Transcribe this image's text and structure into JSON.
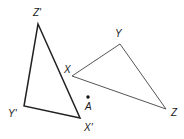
{
  "diagram": {
    "type": "geometry-rotation",
    "colors": {
      "primary_triangle": "#222222",
      "image_triangle": "#555555",
      "labels": "#1a1a1a",
      "background": "#ffffff"
    },
    "triangles": [
      {
        "name": "XYZ",
        "vertices": [
          {
            "id": "X",
            "label": "X",
            "x": 72,
            "y": 76,
            "lx": 64,
            "ly": 73
          },
          {
            "id": "Y",
            "label": "Y",
            "x": 120,
            "y": 44,
            "lx": 115,
            "ly": 36
          },
          {
            "id": "Z",
            "label": "Z",
            "x": 166,
            "y": 109,
            "lx": 171,
            "ly": 116
          }
        ]
      },
      {
        "name": "X'Y'Z'",
        "vertices": [
          {
            "id": "Xp",
            "label": "X'",
            "x": 80,
            "y": 118,
            "lx": 84,
            "ly": 131
          },
          {
            "id": "Yp",
            "label": "Y'",
            "x": 24,
            "y": 106,
            "lx": 8,
            "ly": 117
          },
          {
            "id": "Zp",
            "label": "Z'",
            "x": 38,
            "y": 24,
            "lx": 33,
            "ly": 16
          }
        ]
      }
    ],
    "point": {
      "id": "A",
      "label": "A",
      "x": 88,
      "y": 97,
      "lx": 85,
      "ly": 110
    }
  }
}
